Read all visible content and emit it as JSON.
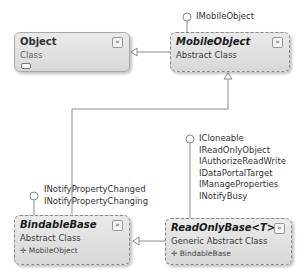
{
  "classes": {
    "object": {
      "name": "Object",
      "kind": "Class"
    },
    "mobile_object": {
      "name": "MobileObject",
      "kind": "Abstract Class"
    },
    "bindable_base": {
      "name": "BindableBase",
      "kind": "Abstract Class",
      "base": "MobileObject"
    },
    "read_only_base": {
      "name": "ReadOnlyBase<T>",
      "kind": "Generic Abstract Class",
      "base": "BindableBase"
    }
  },
  "interfaces": {
    "mobile_object": [
      "IMobileObject"
    ],
    "bindable_base": [
      "INotifyPropertyChanged",
      "INotifyPropertyChanging"
    ],
    "read_only_base": [
      "ICloneable",
      "IReadOnlyObject",
      "IAuthorizeReadWrite",
      "IDataPortalTarget",
      "IManageProperties",
      "INotifyBusy"
    ]
  },
  "icons": {
    "toggle": "»",
    "inherit_arrow": "✛"
  },
  "colors": {
    "line": "#8c8c8c",
    "box_fill_top": "#eaeaea",
    "box_fill_bottom": "#d8d8d8"
  }
}
